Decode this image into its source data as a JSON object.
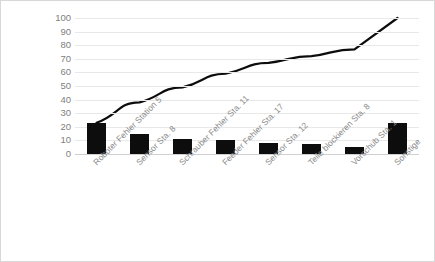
{
  "chart_data": {
    "type": "bar",
    "title": "",
    "subtitle": "",
    "xlabel": "",
    "ylabel": "",
    "ylim": [
      0,
      100
    ],
    "yticks": [
      0,
      10,
      20,
      30,
      40,
      50,
      60,
      70,
      80,
      90,
      100
    ],
    "ytick_labels": [
      "0",
      "10",
      "20",
      "30",
      "40",
      "50",
      "60",
      "70",
      "80",
      "90",
      "100"
    ],
    "grid": true,
    "legend": "none",
    "categories": [
      "Roboter Fehler Station 5",
      "Sensor Sta. 8",
      "Schrauber Fehler Sta. 11",
      "Feeder Fehler Sta. 17",
      "Sensor Sta. 12",
      "Teile blockieren Sta. 8",
      "Vorschub Sta. 1",
      "Sonstige"
    ],
    "series": [
      {
        "name": "Fehleranzahl",
        "type": "bar",
        "color": "#0d0d0d",
        "values": [
          23,
          15,
          11,
          10,
          8,
          7,
          5,
          23
        ]
      },
      {
        "name": "Kumuliert",
        "type": "line",
        "color": "#0d0d0d",
        "values": [
          23,
          38,
          49,
          59,
          67,
          72,
          77,
          100
        ]
      }
    ]
  },
  "axis": {
    "y_max_label": "100",
    "y_min_label": "0"
  }
}
